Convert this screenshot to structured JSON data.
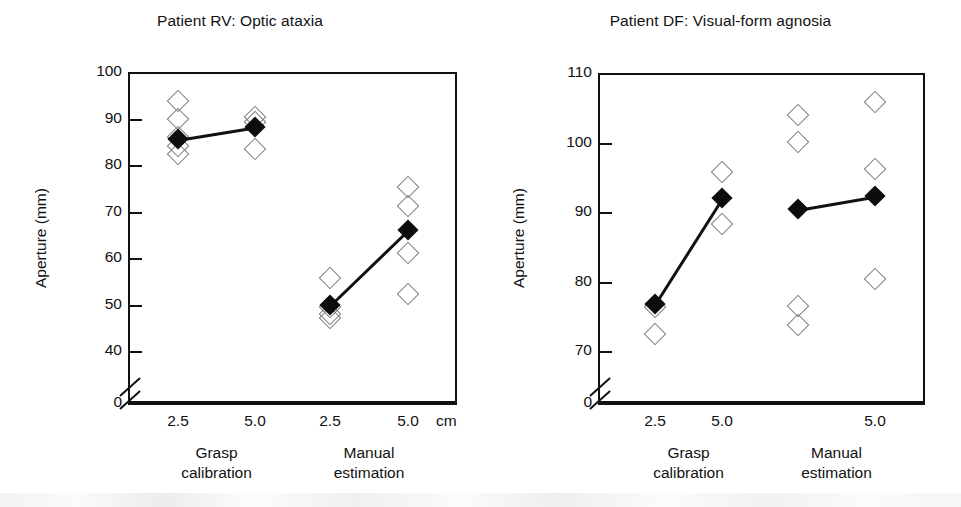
{
  "figure": {
    "shared_ylabel": "Aperture (mm)",
    "unit_label": "cm",
    "group_labels": [
      {
        "line1": "Grasp",
        "line2": "calibration"
      },
      {
        "line1": "Manual",
        "line2": "estimation"
      }
    ]
  },
  "chart_data": [
    {
      "type": "scatter",
      "panel": "left",
      "title": "Patient RV: Optic ataxia",
      "xlabel": "",
      "ylabel": "Aperture (mm)",
      "x_unit": "cm",
      "ylim": [
        40,
        100
      ],
      "y_break_to_zero": true,
      "yticks": [
        0,
        40,
        50,
        60,
        70,
        80,
        90,
        100
      ],
      "ytick_labels": [
        "0",
        "40",
        "50",
        "60",
        "70",
        "80",
        "90",
        "100"
      ],
      "grid": false,
      "legend": "none",
      "categories": [
        "2.5",
        "5.0",
        "2.5",
        "5.0"
      ],
      "groups": [
        "Grasp calibration",
        "Grasp calibration",
        "Manual estimation",
        "Manual estimation"
      ],
      "series": [
        {
          "name": "mean aperture",
          "marker": "filled-diamond",
          "values": [
            85.5,
            88.2,
            49.8,
            66.0
          ],
          "connected_pairs": [
            [
              0,
              1
            ],
            [
              2,
              3
            ]
          ]
        },
        {
          "name": "individual trials",
          "marker": "open-diamond",
          "points": [
            {
              "category_index": 0,
              "values": [
                93.8,
                90.0,
                86.0,
                84.0,
                82.3
              ]
            },
            {
              "category_index": 1,
              "values": [
                90.4,
                89.2,
                83.5
              ]
            },
            {
              "category_index": 2,
              "values": [
                55.8,
                49.5,
                48.0,
                47.2
              ]
            },
            {
              "category_index": 3,
              "values": [
                75.2,
                71.2,
                61.0,
                52.3
              ]
            }
          ]
        }
      ]
    },
    {
      "type": "scatter",
      "panel": "right",
      "title": "Patient DF: Visual-form agnosia",
      "xlabel": "",
      "ylabel": "Aperture (mm)",
      "x_unit": "cm",
      "ylim": [
        70,
        110
      ],
      "y_break_to_zero": true,
      "yticks": [
        0,
        70,
        80,
        90,
        100,
        110
      ],
      "ytick_labels": [
        "0",
        "70",
        "80",
        "90",
        "100",
        "110"
      ],
      "grid": false,
      "legend": "none",
      "categories": [
        "2.5",
        "5.0",
        "",
        "5.0"
      ],
      "groups": [
        "Grasp calibration",
        "Grasp calibration",
        "Manual estimation",
        "Manual estimation"
      ],
      "series": [
        {
          "name": "mean aperture",
          "marker": "filled-diamond",
          "values": [
            76.8,
            92.0,
            90.4,
            92.3
          ],
          "connected_pairs": [
            [
              0,
              1
            ],
            [
              2,
              3
            ]
          ]
        },
        {
          "name": "individual trials",
          "marker": "open-diamond",
          "points": [
            {
              "category_index": 0,
              "values": [
                76.3,
                72.5
              ]
            },
            {
              "category_index": 1,
              "values": [
                95.7,
                88.3
              ]
            },
            {
              "category_index": 2,
              "values": [
                104.0,
                100.1,
                76.5,
                73.8
              ]
            },
            {
              "category_index": 3,
              "values": [
                105.8,
                96.2,
                80.4
              ]
            }
          ]
        }
      ]
    }
  ]
}
